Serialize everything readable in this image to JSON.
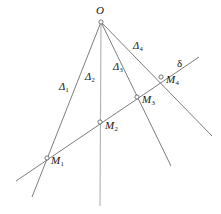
{
  "figure": {
    "kind": "geometry-line-diagram",
    "width": 221,
    "height": 214,
    "background_color": "#ffffff",
    "stroke_color": "#6e6e6e",
    "vertical_stroke_color": "#b0b0b0",
    "label_color": "#141414"
  },
  "labels": {
    "apex": {
      "text": "O",
      "sub": ""
    },
    "ray1": {
      "text": "Δ",
      "sub": "1"
    },
    "ray2": {
      "text": "Δ",
      "sub": "2"
    },
    "ray3": {
      "text": "Δ",
      "sub": "3"
    },
    "ray4": {
      "text": "Δ",
      "sub": "4"
    },
    "transversal": {
      "text": "δ",
      "sub": ""
    },
    "point1": {
      "text": "M",
      "sub": "1"
    },
    "point2": {
      "text": "M",
      "sub": "2"
    },
    "point3": {
      "text": "M",
      "sub": "3"
    },
    "point4": {
      "text": "M",
      "sub": "4"
    }
  },
  "geometry": {
    "apex": {
      "x": 101,
      "y": 22
    },
    "rays": [
      {
        "name": "delta-1",
        "x1": 101,
        "y1": 22,
        "x2": 32,
        "y2": 197
      },
      {
        "name": "delta-2",
        "x1": 101,
        "y1": 22,
        "x2": 100,
        "y2": 206
      },
      {
        "name": "delta-3",
        "x1": 101,
        "y1": 22,
        "x2": 171,
        "y2": 166
      },
      {
        "name": "delta-4",
        "x1": 101,
        "y1": 22,
        "x2": 212,
        "y2": 136
      }
    ],
    "transversal": {
      "name": "delta",
      "x1": 16,
      "y1": 181,
      "x2": 199,
      "y2": 57
    },
    "nodes": [
      {
        "name": "M1",
        "x": 47,
        "y": 158
      },
      {
        "name": "M2",
        "x": 100,
        "y": 122
      },
      {
        "name": "M3",
        "x": 137,
        "y": 97
      },
      {
        "name": "M4",
        "x": 161,
        "y": 77
      }
    ],
    "label_positions": {
      "apex": {
        "x": 96,
        "y": 5
      },
      "ray1": {
        "x": 59,
        "y": 82
      },
      "ray2": {
        "x": 85,
        "y": 72
      },
      "ray3": {
        "x": 113,
        "y": 62
      },
      "ray4": {
        "x": 133,
        "y": 41
      },
      "transversal": {
        "x": 177,
        "y": 58
      },
      "point1": {
        "x": 51,
        "y": 155
      },
      "point2": {
        "x": 105,
        "y": 120
      },
      "point3": {
        "x": 142,
        "y": 94
      },
      "point4": {
        "x": 166,
        "y": 74
      }
    }
  }
}
